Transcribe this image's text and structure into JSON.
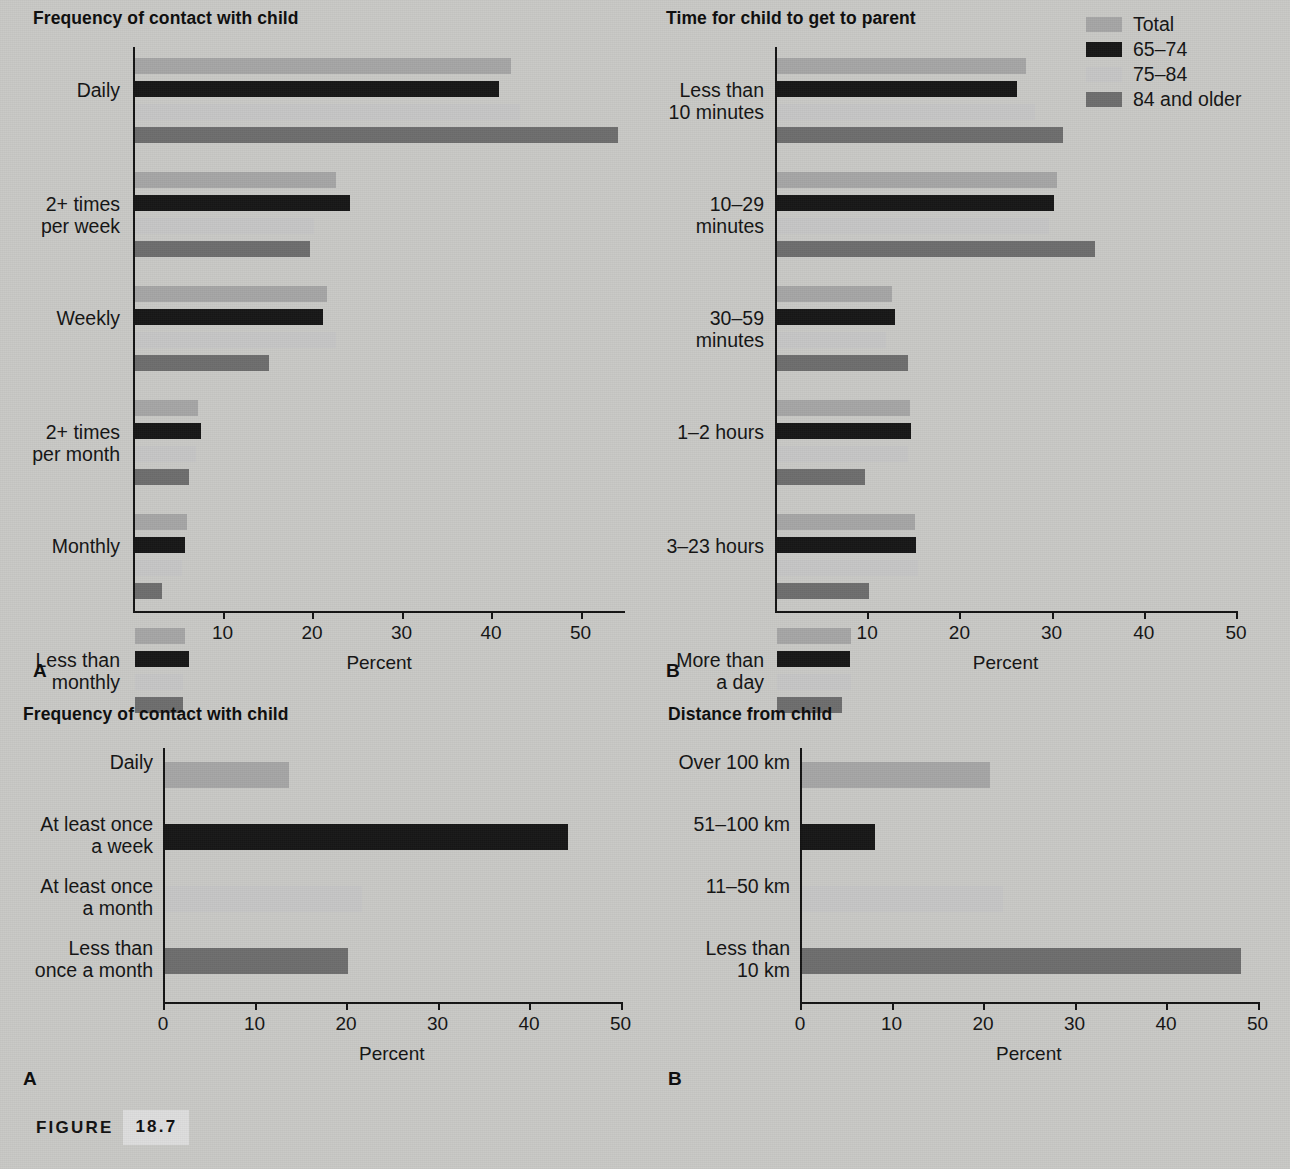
{
  "figure": {
    "caption_word": "FIGURE",
    "caption_number": "18.7"
  },
  "legend": {
    "items": [
      {
        "label": "Total",
        "color": "#a6a6a6"
      },
      {
        "label": "65–74",
        "color": "#171717"
      },
      {
        "label": "75–84",
        "color": "#c6c6c6"
      },
      {
        "label": "84 and older",
        "color": "#6e6e6e"
      }
    ]
  },
  "panels": {
    "top_left": {
      "letter": "A",
      "title": "Frequency of contact with child"
    },
    "top_right": {
      "letter": "B",
      "title": "Time for child to get to parent"
    },
    "bottom_left": {
      "letter": "A",
      "title": "Frequency of contact with child"
    },
    "bottom_right": {
      "letter": "B",
      "title": "Distance from child"
    }
  },
  "chart_data": [
    {
      "id": "top_left",
      "type": "bar",
      "orientation": "horizontal",
      "title": "Frequency of contact with child",
      "panel_letter": "A",
      "xlabel": "Percent",
      "ylabel": "",
      "xlim": [
        0,
        55
      ],
      "xticks": [
        10,
        20,
        30,
        40,
        50
      ],
      "xticklabels": [
        "10",
        "20",
        "30",
        "40",
        "50"
      ],
      "grid": false,
      "legend_position": "outside-top-right",
      "categories": [
        "Daily",
        "2+ times\nper week",
        "Weekly",
        "2+ times\nper month",
        "Monthly",
        "Less than\nmonthly"
      ],
      "series": [
        {
          "name": "Total",
          "color": "#a6a6a6",
          "values": [
            42.0,
            22.5,
            21.5,
            7.0,
            5.8,
            5.6
          ]
        },
        {
          "name": "65–74",
          "color": "#171717",
          "values": [
            40.7,
            24.0,
            21.0,
            7.4,
            5.6,
            6.0
          ]
        },
        {
          "name": "75–84",
          "color": "#c6c6c6",
          "values": [
            43.0,
            20.0,
            22.5,
            6.8,
            5.2,
            5.4
          ]
        },
        {
          "name": "84 and older",
          "color": "#6e6e6e",
          "values": [
            54.0,
            19.5,
            15.0,
            6.0,
            3.0,
            5.4
          ]
        }
      ]
    },
    {
      "id": "top_right",
      "type": "bar",
      "orientation": "horizontal",
      "title": "Time for child to get to parent",
      "panel_letter": "B",
      "xlabel": "Percent",
      "ylabel": "",
      "xlim": [
        0,
        50
      ],
      "xticks": [
        10,
        20,
        30,
        40,
        50
      ],
      "xticklabels": [
        "10",
        "20",
        "30",
        "40",
        "50"
      ],
      "grid": false,
      "legend_position": "outside-top-right",
      "categories": [
        "Less than\n10 minutes",
        "10–29\nminutes",
        "30–59\nminutes",
        "1–2 hours",
        "3–23 hours",
        "More than\na day"
      ],
      "series": [
        {
          "name": "Total",
          "color": "#a6a6a6",
          "values": [
            27.0,
            30.4,
            12.5,
            14.4,
            15.0,
            8.0
          ]
        },
        {
          "name": "65–74",
          "color": "#171717",
          "values": [
            26.0,
            30.0,
            12.8,
            14.5,
            15.1,
            7.9
          ]
        },
        {
          "name": "75–84",
          "color": "#c6c6c6",
          "values": [
            28.0,
            29.5,
            11.8,
            14.2,
            15.3,
            8.0
          ]
        },
        {
          "name": "84 and older",
          "color": "#6e6e6e",
          "values": [
            31.0,
            34.5,
            14.2,
            9.5,
            10.0,
            7.0
          ]
        }
      ]
    },
    {
      "id": "bottom_left",
      "type": "bar",
      "orientation": "horizontal",
      "title": "Frequency of contact with child",
      "panel_letter": "A",
      "xlabel": "Percent",
      "ylabel": "",
      "xlim": [
        0,
        50
      ],
      "xticks": [
        0,
        10,
        20,
        30,
        40,
        50
      ],
      "xticklabels": [
        "0",
        "10",
        "20",
        "30",
        "40",
        "50"
      ],
      "grid": false,
      "categories": [
        "Daily",
        "At least once\na week",
        "At least once\na month",
        "Less than\nonce a month"
      ],
      "values": [
        13.5,
        44.0,
        21.5,
        20.0
      ],
      "colors": [
        "#a6a6a6",
        "#171717",
        "#c6c6c6",
        "#6e6e6e"
      ]
    },
    {
      "id": "bottom_right",
      "type": "bar",
      "orientation": "horizontal",
      "title": "Distance from child",
      "panel_letter": "B",
      "xlabel": "Percent",
      "ylabel": "",
      "xlim": [
        0,
        50
      ],
      "xticks": [
        0,
        10,
        20,
        30,
        40,
        50
      ],
      "xticklabels": [
        "0",
        "10",
        "20",
        "30",
        "40",
        "50"
      ],
      "grid": false,
      "categories": [
        "Over 100 km",
        "51–100 km",
        "11–50 km",
        "Less than\n10 km"
      ],
      "values": [
        20.5,
        8.0,
        22.0,
        48.0
      ],
      "colors": [
        "#a6a6a6",
        "#171717",
        "#c6c6c6",
        "#6e6e6e"
      ]
    }
  ]
}
